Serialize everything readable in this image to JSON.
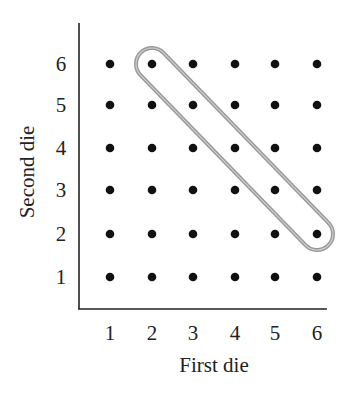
{
  "chart_data": {
    "type": "scatter",
    "title": "",
    "xlabel": "First die",
    "ylabel": "Second die",
    "x_ticks": [
      "1",
      "2",
      "3",
      "4",
      "5",
      "6"
    ],
    "y_ticks": [
      "1",
      "2",
      "3",
      "4",
      "5",
      "6"
    ],
    "xlim": [
      0.5,
      6.5
    ],
    "ylim": [
      0.5,
      6.5
    ],
    "grid": false,
    "legend": null,
    "points": [
      [
        1,
        1
      ],
      [
        2,
        1
      ],
      [
        3,
        1
      ],
      [
        4,
        1
      ],
      [
        5,
        1
      ],
      [
        6,
        1
      ],
      [
        1,
        2
      ],
      [
        2,
        2
      ],
      [
        3,
        2
      ],
      [
        4,
        2
      ],
      [
        5,
        2
      ],
      [
        6,
        2
      ],
      [
        1,
        3
      ],
      [
        2,
        3
      ],
      [
        3,
        3
      ],
      [
        4,
        3
      ],
      [
        5,
        3
      ],
      [
        6,
        3
      ],
      [
        1,
        4
      ],
      [
        2,
        4
      ],
      [
        3,
        4
      ],
      [
        4,
        4
      ],
      [
        5,
        4
      ],
      [
        6,
        4
      ],
      [
        1,
        5
      ],
      [
        2,
        5
      ],
      [
        3,
        5
      ],
      [
        4,
        5
      ],
      [
        5,
        5
      ],
      [
        6,
        5
      ],
      [
        1,
        6
      ],
      [
        2,
        6
      ],
      [
        3,
        6
      ],
      [
        4,
        6
      ],
      [
        5,
        6
      ],
      [
        6,
        6
      ]
    ],
    "highlighted_group": {
      "description": "Outcomes where the sum equals 8",
      "points": [
        [
          2,
          6
        ],
        [
          3,
          5
        ],
        [
          4,
          4
        ],
        [
          5,
          3
        ],
        [
          6,
          2
        ]
      ],
      "outline_color": "#999999"
    },
    "point_color": "#111111"
  }
}
